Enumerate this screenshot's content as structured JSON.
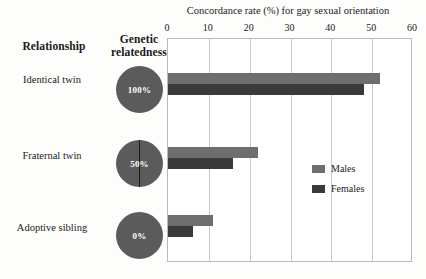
{
  "columns": {
    "relationship_header": "Relationship",
    "genetic_header": "Genetic relatedness"
  },
  "rows": [
    {
      "relationship": "Identical twin",
      "relatedness": "100%",
      "relatedness_value": 100
    },
    {
      "relationship": "Fraternal twin",
      "relatedness": "50%",
      "relatedness_value": 50
    },
    {
      "relationship": "Adoptive sibling",
      "relatedness": "0%",
      "relatedness_value": 0
    }
  ],
  "legend": {
    "males": "Males",
    "females": "Females"
  },
  "colors": {
    "males": "#6e6e6e",
    "females": "#3a3a3a",
    "pie": "#5b5b5b",
    "frame": "#b9b9b9",
    "grid": "#c9c9c9"
  },
  "chart_data": {
    "type": "bar",
    "orientation": "horizontal",
    "title": "Concordance rate (%) for gay sexual orientation",
    "xlabel": "Concordance rate (%) for gay sexual orientation",
    "ylabel": "",
    "categories": [
      "Identical twin",
      "Fraternal twin",
      "Adoptive sibling"
    ],
    "series": [
      {
        "name": "Males",
        "values": [
          52,
          22,
          11
        ]
      },
      {
        "name": "Females",
        "values": [
          48,
          16,
          6
        ]
      }
    ],
    "xlim": [
      0,
      60
    ],
    "xticks": [
      0,
      10,
      20,
      30,
      40,
      50,
      60
    ],
    "xtick_labels": [
      "0",
      "10",
      "20",
      "30",
      "40",
      "50",
      "60"
    ],
    "grid": true,
    "legend_position": "right-middle"
  }
}
